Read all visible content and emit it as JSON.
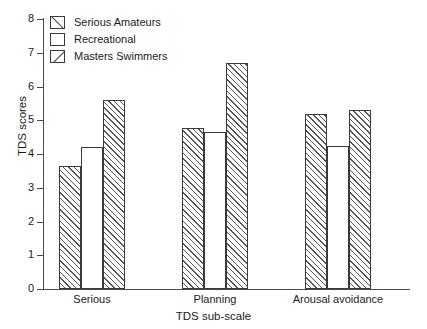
{
  "chart_data": {
    "type": "bar",
    "title": "",
    "xlabel": "TDS sub-scale",
    "ylabel": "TDS scores",
    "ylim": [
      0,
      8
    ],
    "ytick_labels": [
      "0",
      "1",
      "2",
      "3",
      "4",
      "5",
      "6",
      "7",
      "8"
    ],
    "ytick_values": [
      0,
      1,
      2,
      3,
      4,
      5,
      6,
      7,
      8
    ],
    "grid": false,
    "legend_position": "upper left (inside axes)",
    "categories": [
      "Serious",
      "Planning",
      "Arousal avoidance"
    ],
    "series": [
      {
        "name": "Serious Amateurs",
        "pattern": "diagonal-backslash",
        "values": [
          3.65,
          4.78,
          5.2
        ]
      },
      {
        "name": "Recreational",
        "pattern": "empty",
        "values": [
          4.2,
          4.65,
          4.25
        ]
      },
      {
        "name": "Masters Swimmers",
        "pattern": "diagonal-forwardslash",
        "values": [
          5.6,
          6.7,
          5.3
        ]
      }
    ]
  },
  "legend": {
    "items": [
      {
        "label": "Serious Amateurs"
      },
      {
        "label": "Recreational"
      },
      {
        "label": "Masters Swimmers"
      }
    ]
  },
  "axes": {
    "y_title": "TDS scores",
    "x_title": "TDS sub-scale",
    "y_ticks": [
      "0",
      "1",
      "2",
      "3",
      "4",
      "5",
      "6",
      "7",
      "8"
    ],
    "x_groups": [
      "Serious",
      "Planning",
      "Arousal avoidance"
    ]
  },
  "colors": {
    "line": "#3a3a3a",
    "axis": "#4a4a4a",
    "hatch": "#555555",
    "background": "#ffffff",
    "text": "#1a1a1a"
  }
}
